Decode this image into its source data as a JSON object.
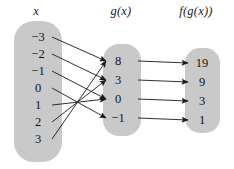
{
  "headers": {
    "domain": "x",
    "middle": "g(x)",
    "range": "f(g(x))"
  },
  "colors": {
    "box_fill": "#c9c9c9",
    "text": "#141414",
    "arrow": "#1a1a1a",
    "background": "#ffffff"
  },
  "sets": {
    "domain": {
      "name": "x",
      "values": [
        "−3",
        "−2",
        "−1",
        "0",
        "1",
        "2",
        "3"
      ]
    },
    "middle": {
      "name": "g(x)",
      "values": [
        "8",
        "3",
        "0",
        "−1"
      ]
    },
    "range": {
      "name": "f(g(x))",
      "values": [
        "19",
        "9",
        "3",
        "1"
      ]
    }
  },
  "mappings": {
    "domain_to_middle": [
      {
        "from": "−3",
        "to": "8"
      },
      {
        "from": "−2",
        "to": "3"
      },
      {
        "from": "−1",
        "to": "0"
      },
      {
        "from": "0",
        "to": "−1"
      },
      {
        "from": "1",
        "to": "0"
      },
      {
        "from": "2",
        "to": "3"
      },
      {
        "from": "3",
        "to": "8"
      }
    ],
    "middle_to_range": [
      {
        "from": "8",
        "to": "19"
      },
      {
        "from": "3",
        "to": "9"
      },
      {
        "from": "0",
        "to": "3"
      },
      {
        "from": "−1",
        "to": "1"
      }
    ]
  },
  "geometry": {
    "domain_y": [
      37,
      54,
      71,
      88,
      105,
      122,
      139
    ],
    "middle_y": [
      61,
      80,
      99,
      118
    ],
    "range_y": [
      63,
      82,
      101,
      120
    ],
    "domain_arrow_start_x": 52,
    "middle_arrow_end_x": 106,
    "middle_arrow_start_x": 138,
    "range_arrow_end_x": 188
  }
}
